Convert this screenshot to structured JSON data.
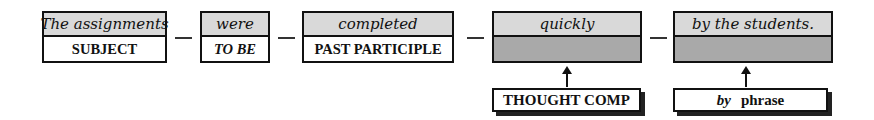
{
  "colors": {
    "top_cell_fill": "#d9d9d9",
    "empty_cell_fill": "#a9a9a9",
    "border": "#111111"
  },
  "sentence_parts": [
    {
      "word": "The assignments",
      "role": "SUBJECT",
      "role_italic": false
    },
    {
      "word": "were",
      "role": "TO BE",
      "role_italic": true
    },
    {
      "word": "completed",
      "role": "PAST PARTICIPLE",
      "role_italic": false
    },
    {
      "word": "quickly",
      "role": "",
      "role_italic": false
    },
    {
      "word": "by the students.",
      "role": "",
      "role_italic": false
    }
  ],
  "connectors": [
    "—",
    "—",
    "—",
    "—"
  ],
  "labels": [
    {
      "text": "THOUGHT COMP",
      "points_to": "quickly"
    },
    {
      "prefix": "by",
      "text": "phrase",
      "points_to": "by the students."
    }
  ]
}
